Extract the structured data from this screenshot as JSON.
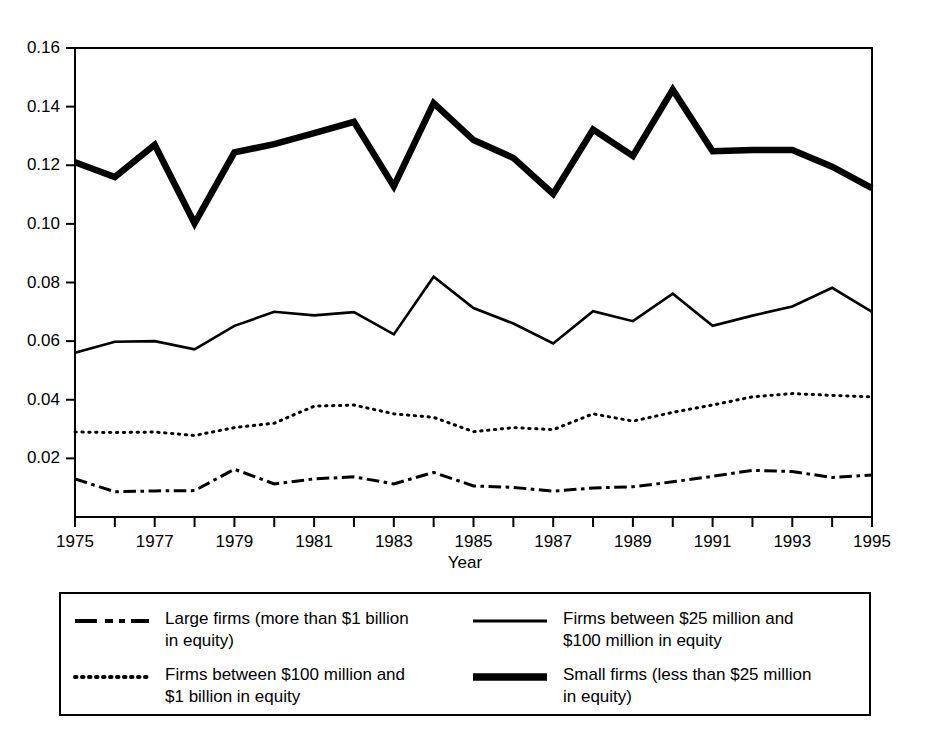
{
  "chart_data": {
    "type": "line",
    "title": "",
    "xlabel": "Year",
    "ylabel": "Probability of trading against insiders",
    "xlim": [
      1975,
      1995
    ],
    "ylim": [
      0,
      0.16
    ],
    "grid": false,
    "legend_position": "below-plot",
    "x": [
      1975,
      1976,
      1977,
      1978,
      1979,
      1980,
      1981,
      1982,
      1983,
      1984,
      1985,
      1986,
      1987,
      1988,
      1989,
      1990,
      1991,
      1992,
      1993,
      1994,
      1995
    ],
    "xtick_labels": [
      "1975",
      "1977",
      "1979",
      "1981",
      "1983",
      "1985",
      "1987",
      "1989",
      "1991",
      "1993",
      "1995"
    ],
    "xtick_values": [
      1975,
      1977,
      1979,
      1981,
      1983,
      1985,
      1987,
      1989,
      1991,
      1993,
      1995
    ],
    "ytick_labels": [
      "0.02",
      "0.04",
      "0.06",
      "0.08",
      "0.10",
      "0.12",
      "0.14",
      "0.16"
    ],
    "ytick_values": [
      0.02,
      0.04,
      0.06,
      0.08,
      0.1,
      0.12,
      0.14,
      0.16
    ],
    "series": [
      {
        "name": "Large firms (more than $1 billion in equity)",
        "style": "dashdot",
        "width": 3,
        "color": "#000000",
        "values": [
          0.013,
          0.0086,
          0.0089,
          0.009,
          0.0163,
          0.0113,
          0.013,
          0.0137,
          0.0113,
          0.0152,
          0.0106,
          0.0101,
          0.0088,
          0.0099,
          0.0103,
          0.012,
          0.0139,
          0.0159,
          0.0155,
          0.0135,
          0.0143
        ]
      },
      {
        "name": "Firms between $100 million and $1 billion in equity",
        "style": "dotted",
        "width": 3,
        "color": "#000000",
        "values": [
          0.029,
          0.0288,
          0.029,
          0.0278,
          0.0305,
          0.032,
          0.0378,
          0.0382,
          0.0352,
          0.034,
          0.0291,
          0.0305,
          0.0298,
          0.0352,
          0.0327,
          0.0357,
          0.0382,
          0.041,
          0.0421,
          0.0415,
          0.041
        ]
      },
      {
        "name": "Firms between $25 million and $100 million in equity",
        "style": "solid",
        "width": 2.6,
        "color": "#000000",
        "values": [
          0.056,
          0.0598,
          0.06,
          0.0572,
          0.0652,
          0.07,
          0.0688,
          0.0699,
          0.0623,
          0.082,
          0.0713,
          0.066,
          0.0592,
          0.0702,
          0.0668,
          0.0762,
          0.0652,
          0.0687,
          0.0718,
          0.0782,
          0.07
        ]
      },
      {
        "name": "Small firms (less than $25 million in equity)",
        "style": "thick",
        "width": 6.5,
        "color": "#000000",
        "values": [
          0.121,
          0.116,
          0.127,
          0.1002,
          0.1244,
          0.1272,
          0.131,
          0.1348,
          0.1128,
          0.1412,
          0.1286,
          0.1225,
          0.1102,
          0.1322,
          0.1232,
          0.1458,
          0.1248,
          0.1252,
          0.1252,
          0.1195,
          0.1122
        ]
      }
    ]
  },
  "legend": {
    "entries": [
      {
        "sample": "dashdot-line-sample",
        "label": "Large firms (more than $1 billion\nin equity)"
      },
      {
        "sample": "dotted-line-sample",
        "label": "Firms between $100 million and\n$1 billion in equity"
      },
      {
        "sample": "solid-line-sample",
        "label": "Firms between $25 million and\n$100 million in equity"
      },
      {
        "sample": "thick-line-sample",
        "label": "Small firms (less than $25 million\nin equity)"
      }
    ]
  }
}
